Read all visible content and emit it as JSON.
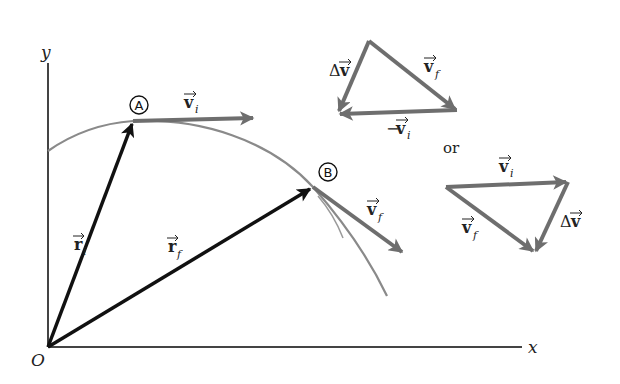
{
  "figure": {
    "axes": {
      "x_label": "x",
      "y_label": "y",
      "origin_label": "O"
    },
    "points": {
      "A": {
        "label": "A"
      },
      "B": {
        "label": "B"
      }
    },
    "vectors": {
      "r_i": {
        "symbol": "r",
        "subscript": "i"
      },
      "r_f": {
        "symbol": "r",
        "subscript": "f"
      },
      "v_i": {
        "symbol": "v",
        "subscript": "i"
      },
      "v_f": {
        "symbol": "v",
        "subscript": "f"
      }
    },
    "triangle_1": {
      "delta_v": {
        "prefix": "Δ",
        "symbol": "v"
      },
      "v_f": {
        "symbol": "v",
        "subscript": "f"
      },
      "neg_v_i": {
        "prefix": "−",
        "symbol": "v",
        "subscript": "i"
      }
    },
    "connector": "or",
    "triangle_2": {
      "v_i": {
        "symbol": "v",
        "subscript": "i"
      },
      "v_f": {
        "symbol": "v",
        "subscript": "f"
      },
      "delta_v": {
        "prefix": "Δ",
        "symbol": "v"
      }
    },
    "colors": {
      "axis": "#444444",
      "trajectory": "#8a8a8a",
      "position_vector": "#111111",
      "velocity_vector": "#6e6e6e"
    }
  }
}
